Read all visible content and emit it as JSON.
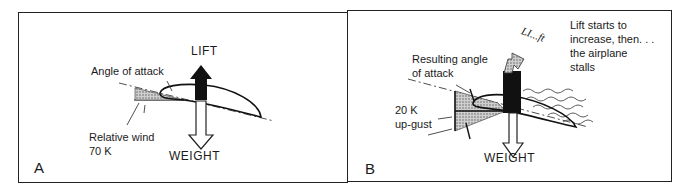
{
  "panels": [
    {
      "id": "A",
      "letter": "A",
      "labels": {
        "lift": "LIFT",
        "angle_of_attack": "Angle of attack",
        "relative_wind": "Relative wind",
        "speed": "70 K",
        "weight": "WEIGHT"
      }
    },
    {
      "id": "B",
      "letter": "B",
      "labels": {
        "lift_fading": "LI...ft",
        "lift_note_line1": "Lift starts to",
        "lift_note_line2": "increase, then. . .",
        "lift_note_line3": "the airplane",
        "lift_note_line4": "stalls",
        "resulting_angle_line1": "Resulting angle",
        "resulting_angle_line2": "of attack",
        "gust_speed": "20 K",
        "gust_label": "up-gust",
        "weight": "WEIGHT"
      }
    }
  ],
  "colors": {
    "ink": "#1a1a1a",
    "background": "#ffffff",
    "stipple": "#9a9a9a"
  }
}
